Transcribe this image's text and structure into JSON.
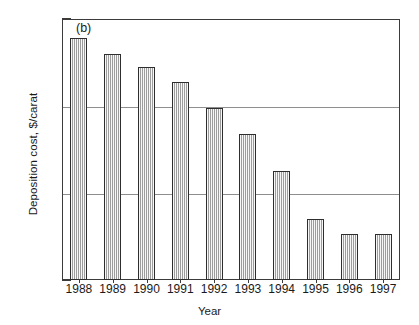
{
  "chart_data": {
    "type": "bar",
    "title": "",
    "panel_label": "(b)",
    "xlabel": "Year",
    "ylabel": "Deposition cost, $/carat",
    "categories": [
      "1988",
      "1989",
      "1990",
      "1991",
      "1992",
      "1993",
      "1994",
      "1995",
      "1996",
      "1997"
    ],
    "values": [
      600,
      400,
      280,
      190,
      95,
      48,
      18,
      5.0,
      3.4,
      3.4
    ],
    "yscale": "log",
    "ylim": [
      1,
      1000
    ],
    "ytick_labels": [
      "1000",
      "100",
      "10",
      "1"
    ],
    "ytick_values": [
      1000,
      100,
      10,
      1
    ],
    "grid": "horizontal-major-only",
    "legend": "none",
    "series": [
      {
        "name": "Deposition cost",
        "values": [
          600,
          400,
          280,
          190,
          95,
          48,
          18,
          5.0,
          3.4,
          3.4
        ]
      }
    ]
  },
  "axis": {
    "y_title": "Deposition cost, $/carat",
    "x_title": "Year"
  },
  "panel": {
    "label": "(b)"
  },
  "colors": {
    "bar_fill": "#c9c9c9",
    "bar_border": "#2e2e2e",
    "axis": "#3b3b3b",
    "gridline": "#8e8e8e",
    "background": "#ffffff",
    "text": "#1a1a1a"
  }
}
